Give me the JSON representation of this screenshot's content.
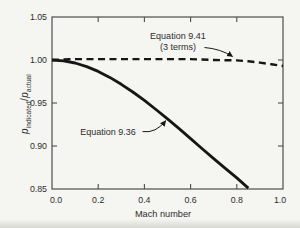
{
  "colors": {
    "background": "#f5f5f1",
    "frame": "#4d4d4d",
    "curve": "#161616",
    "text": "#2d2d2d"
  },
  "y_axis_title": {
    "p_first": "p",
    "sub_first": "indicated",
    "divider": "/",
    "p_second": "p",
    "sub_second": "actual"
  },
  "chart_data": {
    "type": "line",
    "title": "",
    "xlabel": "Mach number",
    "ylabel": "p_indicated / p_actual",
    "xlim": [
      0.0,
      1.0
    ],
    "ylim": [
      0.85,
      1.05
    ],
    "grid": false,
    "frame": "box",
    "legend_position": "none (inline annotations with arrows)",
    "x_ticks": [
      0.0,
      0.2,
      0.4,
      0.6,
      0.8,
      1.0
    ],
    "x_tick_labels": [
      "0.0",
      "0.2",
      "0.4",
      "0.6",
      "0.8",
      "1.0"
    ],
    "y_ticks": [
      0.85,
      0.9,
      0.95,
      1.0,
      1.05
    ],
    "y_tick_labels": [
      "0.85",
      "0.90",
      "0.95",
      "1.00",
      "1.05"
    ],
    "series": [
      {
        "name": "Equation 9.36",
        "style": "solid",
        "width": 2.8,
        "x": [
          0,
          0.05,
          0.1,
          0.15,
          0.2,
          0.25,
          0.3,
          0.35,
          0.4,
          0.45,
          0.5,
          0.55,
          0.6,
          0.65,
          0.7,
          0.75,
          0.8,
          0.85
        ],
        "y": [
          1.0,
          0.9991,
          0.9965,
          0.9923,
          0.9867,
          0.9798,
          0.9718,
          0.9628,
          0.953,
          0.9425,
          0.9315,
          0.9202,
          0.9086,
          0.8969,
          0.8853,
          0.8739,
          0.8629,
          0.851
        ]
      },
      {
        "name": "Equation 9.41 (3 terms)",
        "style": "dashed",
        "width": 2.4,
        "x": [
          0,
          0.1,
          0.2,
          0.3,
          0.4,
          0.5,
          0.6,
          0.7,
          0.8,
          0.85,
          0.9,
          0.95,
          1.0
        ],
        "y": [
          1.0,
          1.001,
          1.001,
          1.001,
          1.001,
          1.001,
          1.001,
          1.0,
          0.9995,
          0.9985,
          0.997,
          0.995,
          0.993
        ]
      }
    ],
    "annotations": [
      {
        "id": "eq-941-label",
        "lines": [
          "Equation 9.41",
          "(3 terms)"
        ],
        "x": 0.545,
        "y": 1.028,
        "arrow": {
          "x1": 0.66,
          "y1": 1.0145,
          "cx": 0.73,
          "cy": 1.013,
          "x2": 0.782,
          "y2": 1.004
        }
      },
      {
        "id": "eq-936-label",
        "lines": [
          "Equation 9.36"
        ],
        "x": 0.242,
        "y": 0.916,
        "arrow": {
          "x1": 0.392,
          "y1": 0.9168,
          "cx": 0.45,
          "cy": 0.9145,
          "x2": 0.492,
          "y2": 0.9295
        }
      }
    ]
  }
}
